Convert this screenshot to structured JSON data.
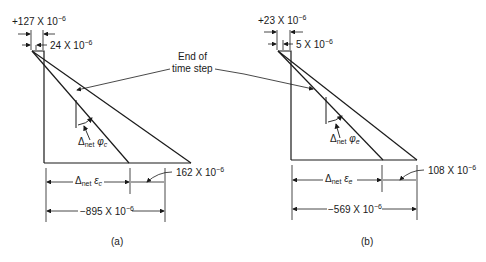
{
  "annotation": {
    "text": "End of",
    "text2": "time step"
  },
  "panel_a": {
    "top_total": "+127 X 10",
    "top_total_exp": "−6",
    "top_inc": "24 X 10",
    "top_inc_exp": "−6",
    "phi_symbol": "Δ",
    "phi_sub": "net",
    "phi_var": "φ",
    "phi_var_sub": "c",
    "eps_symbol": "Δ",
    "eps_sub": "net",
    "eps_var": "ε",
    "eps_var_sub": "c",
    "bottom_inc": "162 X 10",
    "bottom_inc_exp": "−6",
    "bottom_total": "−895 X 10",
    "bottom_total_exp": "−6",
    "caption": "(a)"
  },
  "panel_b": {
    "top_total": "+23 X 10",
    "top_total_exp": "−6",
    "top_inc": "5 X 10",
    "top_inc_exp": "−6",
    "phi_symbol": "Δ",
    "phi_sub": "net",
    "phi_var": "φ",
    "phi_var_sub": "e",
    "eps_symbol": "Δ",
    "eps_sub": "net",
    "eps_var": "ε",
    "eps_var_sub": "e",
    "bottom_inc": "108 X 10",
    "bottom_inc_exp": "−6",
    "bottom_total": "−569 X 10",
    "bottom_total_exp": "−6",
    "caption": "(b)"
  }
}
